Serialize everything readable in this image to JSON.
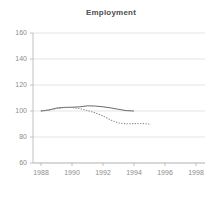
{
  "chart_data": {
    "type": "line",
    "title": "Employment",
    "xlabel": "",
    "ylabel": "",
    "xlim": [
      1988,
      1998
    ],
    "ylim": [
      60,
      160
    ],
    "grid": true,
    "legend": "none",
    "xticks": [
      "1988",
      "1990",
      "1992",
      "1994",
      "1996",
      "1998"
    ],
    "xtick_values": [
      1988,
      1990,
      1992,
      1994,
      1996,
      1998
    ],
    "yticks": [
      "60",
      "80",
      "100",
      "120",
      "140",
      "160"
    ],
    "ytick_values": [
      60,
      80,
      100,
      120,
      140,
      160
    ],
    "series": [
      {
        "name": "solid-line",
        "style": "solid",
        "color": "#595959",
        "x": [
          1988,
          1988.5,
          1989,
          1989.5,
          1990,
          1990.5,
          1991,
          1991.5,
          1992,
          1992.5,
          1993,
          1993.5,
          1994
        ],
        "values": [
          100.0,
          100.8,
          102.2,
          102.8,
          102.9,
          103.2,
          104.0,
          103.8,
          103.2,
          102.4,
          101.3,
          100.3,
          100.0
        ]
      },
      {
        "name": "dotted-line",
        "style": "dotted",
        "color": "#8c8c8c",
        "x": [
          1988,
          1988.5,
          1989,
          1989.5,
          1990,
          1990.5,
          1991,
          1991.5,
          1992,
          1992.5,
          1993,
          1993.5,
          1994,
          1994.5,
          1995
        ],
        "values": [
          100.0,
          100.6,
          102.0,
          102.6,
          102.7,
          101.8,
          100.4,
          98.6,
          96.2,
          93.0,
          90.8,
          90.2,
          90.3,
          90.4,
          90.0
        ]
      }
    ]
  },
  "axes": {
    "axis_color": "#b3b3b3",
    "grid_color": "#d9d9d9",
    "tick_color": "#b3b3b3"
  }
}
